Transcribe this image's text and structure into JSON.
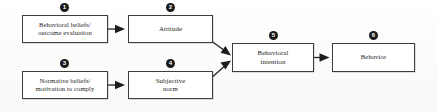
{
  "diagram": {
    "nodes": [
      {
        "id": "behavioral-beliefs",
        "marker": "1",
        "label": "Behavioral beliefs/\noutcome evaluation",
        "x": 22,
        "y": 15,
        "w": 86,
        "h": 28,
        "marker_x": 60,
        "marker_y": 3
      },
      {
        "id": "attitude",
        "marker": "2",
        "label": "Attitude",
        "x": 128,
        "y": 15,
        "w": 85,
        "h": 28,
        "marker_x": 166,
        "marker_y": 3
      },
      {
        "id": "normative-beliefs",
        "marker": "3",
        "label": "Normative beliefs/\nmotivation to comply",
        "x": 22,
        "y": 71,
        "w": 86,
        "h": 28,
        "marker_x": 60,
        "marker_y": 59
      },
      {
        "id": "subjective-norm",
        "marker": "4",
        "label": "Subjective\nnorm",
        "x": 128,
        "y": 71,
        "w": 85,
        "h": 28,
        "marker_x": 166,
        "marker_y": 59
      },
      {
        "id": "behavioral-intention",
        "marker": "5",
        "label": "Behavioral\nintention",
        "x": 232,
        "y": 43,
        "w": 82,
        "h": 29,
        "marker_x": 269,
        "marker_y": 31
      },
      {
        "id": "behavior",
        "marker": "6",
        "label": "Behavior",
        "x": 332,
        "y": 43,
        "w": 83,
        "h": 29,
        "marker_x": 369,
        "marker_y": 31
      }
    ],
    "arrows": [
      {
        "id": "beliefs-to-attitude",
        "from": "behavioral-beliefs",
        "to": "attitude",
        "path": "M 108 29 L 124 29",
        "head": "124,29 116,25.5 116,32.5"
      },
      {
        "id": "normative-to-subjective",
        "from": "normative-beliefs",
        "to": "subjective-norm",
        "path": "M 108 85 L 124 85",
        "head": "124,85 116,81.5 116,88.5"
      },
      {
        "id": "attitude-to-intention",
        "from": "attitude",
        "to": "behavioral-intention",
        "path": "M 210 40 L 229 54",
        "head": "231,55.5 222.5,53.5 226.5,48"
      },
      {
        "id": "subjective-to-intention",
        "from": "subjective-norm",
        "to": "behavioral-intention",
        "path": "M 210 79 L 229 62",
        "head": "231,60.5 222.5,62 226,67.5"
      },
      {
        "id": "intention-to-behavior",
        "from": "behavioral-intention",
        "to": "behavior",
        "path": "M 314 57.5 L 329 57.5",
        "head": "329,57.5 321,54 321,61"
      }
    ],
    "font_sizes": {
      "node_label": "6.6px",
      "marker": "6px"
    }
  }
}
